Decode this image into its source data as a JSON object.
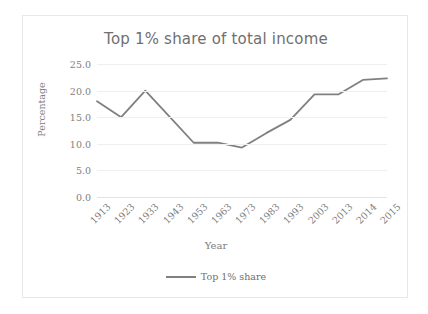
{
  "chart_data": {
    "type": "line",
    "title": "Top 1% share of total income",
    "xlabel": "Year",
    "ylabel": "Percentage",
    "categories": [
      "1913",
      "1923",
      "1933",
      "1943",
      "1953",
      "1963",
      "1973",
      "1983",
      "1993",
      "2003",
      "2013",
      "2014",
      "2015"
    ],
    "series": [
      {
        "name": "Top 1% share",
        "color": "#808080",
        "values": [
          18.0,
          15.0,
          20.0,
          15.1,
          10.2,
          10.2,
          9.3,
          12.0,
          14.5,
          19.3,
          19.3,
          22.0,
          22.3
        ]
      }
    ],
    "ylim": [
      0.0,
      25.0
    ],
    "ytick_labels": [
      "25.0",
      "20.0",
      "15.0",
      "10.0",
      "5.0",
      "0.0"
    ],
    "ytick_values": [
      25.0,
      20.0,
      15.0,
      10.0,
      5.0,
      0.0
    ],
    "ytick_step": 5.0,
    "grid": true,
    "legend_position": "bottom",
    "legend_entries": [
      "Top 1% share"
    ]
  }
}
